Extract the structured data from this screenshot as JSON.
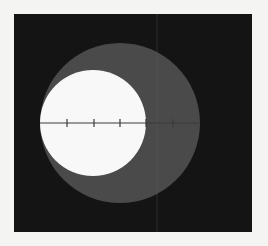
{
  "figure": {
    "panel": {
      "x": 14,
      "y": 14,
      "width": 238,
      "height": 218,
      "color": "#141414"
    },
    "outer_circle": {
      "cx": 120,
      "cy": 123,
      "r": 80,
      "color": "#4a4a4a"
    },
    "inner_circle": {
      "cx": 93,
      "cy": 123,
      "r": 53,
      "color": "#f8f8f8"
    },
    "axis_line": {
      "x1": 40,
      "x2": 199,
      "y": 123,
      "color": "#3a3a3a"
    },
    "ticks": [
      67,
      94,
      120,
      146,
      173
    ],
    "artifact_line": {
      "x": 157,
      "color": "#5a5a5a"
    }
  }
}
